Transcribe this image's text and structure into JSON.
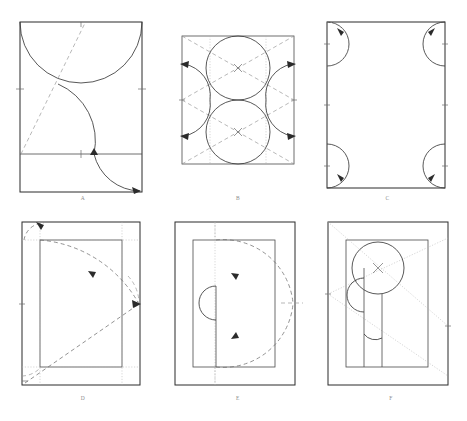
{
  "figure": {
    "background_color": "#ffffff",
    "line_color": "#2b2b2b",
    "construction_color": "#9a9a9a",
    "width": 467,
    "height": 421
  },
  "panels": [
    {
      "id": "A",
      "label": "A",
      "position": {
        "x": 18,
        "y": 20,
        "w": 122,
        "h": 170
      },
      "elements": [
        "outer-rectangle",
        "horizontal-division-line",
        "large-top-semicircle-arc",
        "s-curve-with-arrowheads",
        "dashed-diagonal",
        "edge-tick-marks"
      ]
    },
    {
      "id": "B",
      "label": "B",
      "position": {
        "x": 180,
        "y": 35,
        "w": 112,
        "h": 128
      },
      "elements": [
        "outer-rectangle",
        "upper-circle",
        "lower-circle",
        "left-outward-arcs-with-arrowheads",
        "right-outward-arcs-with-arrowheads",
        "dashed-diagonals",
        "dotted-vertical-guides",
        "center-x-marks"
      ]
    },
    {
      "id": "C",
      "label": "C",
      "position": {
        "x": 325,
        "y": 22,
        "w": 118,
        "h": 166
      },
      "elements": [
        "outer-rectangle",
        "top-left-corner-arc",
        "top-right-corner-arc",
        "bottom-left-corner-arc",
        "bottom-right-corner-arc",
        "arrowheads",
        "edge-tick-marks"
      ]
    },
    {
      "id": "D",
      "label": "D",
      "position": {
        "x": 22,
        "y": 222,
        "w": 118,
        "h": 163
      },
      "elements": [
        "outer-rectangle",
        "inner-rectangle",
        "dashed-sweep-arc-upper",
        "dashed-diagonal-lower",
        "dashed-corner-arc",
        "dotted-guides",
        "arrowheads"
      ]
    },
    {
      "id": "E",
      "label": "E",
      "position": {
        "x": 175,
        "y": 222,
        "w": 120,
        "h": 163
      },
      "elements": [
        "outer-rectangle",
        "inner-rectangle",
        "vertical-center-line",
        "left-semicircle",
        "dashed-upper-curve",
        "dashed-lower-curve",
        "dotted-vertical-axis",
        "arrowheads"
      ]
    },
    {
      "id": "F",
      "label": "F",
      "position": {
        "x": 328,
        "y": 222,
        "w": 120,
        "h": 163
      },
      "elements": [
        "outer-rectangle",
        "inner-rectangle",
        "circle-with-x-center",
        "left-semicircle",
        "vertical-lines",
        "bottom-concave-arc",
        "dotted-diagonals"
      ]
    }
  ]
}
